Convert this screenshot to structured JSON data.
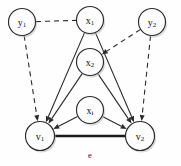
{
  "diagram": {
    "background_color": "#fefefe",
    "stroke_color": "#2b2b2b",
    "nodes": [
      {
        "id": "y1",
        "base": "y",
        "sub": "1",
        "cx": 22,
        "cy": 22,
        "r": 13.5,
        "name": "node-y1"
      },
      {
        "id": "x1",
        "base": "x",
        "sub": "1",
        "cx": 90,
        "cy": 20,
        "r": 13.5,
        "name": "node-x1"
      },
      {
        "id": "y2",
        "base": "y",
        "sub": "2",
        "cx": 152,
        "cy": 22,
        "r": 13.5,
        "name": "node-y2"
      },
      {
        "id": "x2",
        "base": "x",
        "sub": "2",
        "cx": 90,
        "cy": 62,
        "r": 13.5,
        "name": "node-x2"
      },
      {
        "id": "xi",
        "base": "x",
        "sub": "i",
        "cx": 90,
        "cy": 110,
        "r": 13.5,
        "name": "node-xi"
      },
      {
        "id": "v1",
        "base": "v",
        "sub": "1",
        "cx": 40,
        "cy": 136,
        "r": 14.5,
        "name": "node-v1"
      },
      {
        "id": "v2",
        "base": "v",
        "sub": "2",
        "cx": 140,
        "cy": 136,
        "r": 14.5,
        "name": "node-v2"
      }
    ],
    "edges": [
      {
        "id": "y1-x1",
        "from": "y1",
        "to": "x1",
        "style": "dashed",
        "arrow": false,
        "name": "edge-y1-x1"
      },
      {
        "id": "y1-v1",
        "from": "y1",
        "to": "v1",
        "style": "dashed",
        "arrow": true,
        "name": "edge-y1-v1"
      },
      {
        "id": "y2-x2",
        "from": "y2",
        "to": "x2",
        "style": "dashed",
        "arrow": true,
        "name": "edge-y2-x2"
      },
      {
        "id": "y2-v2",
        "from": "y2",
        "to": "v2",
        "style": "dashed",
        "arrow": true,
        "name": "edge-y2-v2"
      },
      {
        "id": "x1-v1",
        "from": "x1",
        "to": "v1",
        "style": "solid",
        "arrow": true,
        "name": "edge-x1-v1"
      },
      {
        "id": "x1-v2",
        "from": "x1",
        "to": "v2",
        "style": "solid",
        "arrow": true,
        "name": "edge-x1-v2"
      },
      {
        "id": "x2-v1",
        "from": "x2",
        "to": "v1",
        "style": "solid",
        "arrow": true,
        "name": "edge-x2-v1"
      },
      {
        "id": "x2-v2",
        "from": "x2",
        "to": "v2",
        "style": "solid",
        "arrow": true,
        "name": "edge-x2-v2"
      },
      {
        "id": "xi-v1",
        "from": "xi",
        "to": "v1",
        "style": "solid",
        "arrow": true,
        "name": "edge-xi-v1"
      },
      {
        "id": "xi-v2",
        "from": "xi",
        "to": "v2",
        "style": "solid",
        "arrow": true,
        "name": "edge-xi-v2"
      },
      {
        "id": "v1-v2",
        "from": "v1",
        "to": "v2",
        "style": "bold",
        "arrow": false,
        "name": "edge-v1-v2"
      }
    ],
    "edge_labels": [
      {
        "id": "e",
        "text": "e",
        "x": 90,
        "y": 155,
        "name": "edge-label-e"
      }
    ]
  }
}
